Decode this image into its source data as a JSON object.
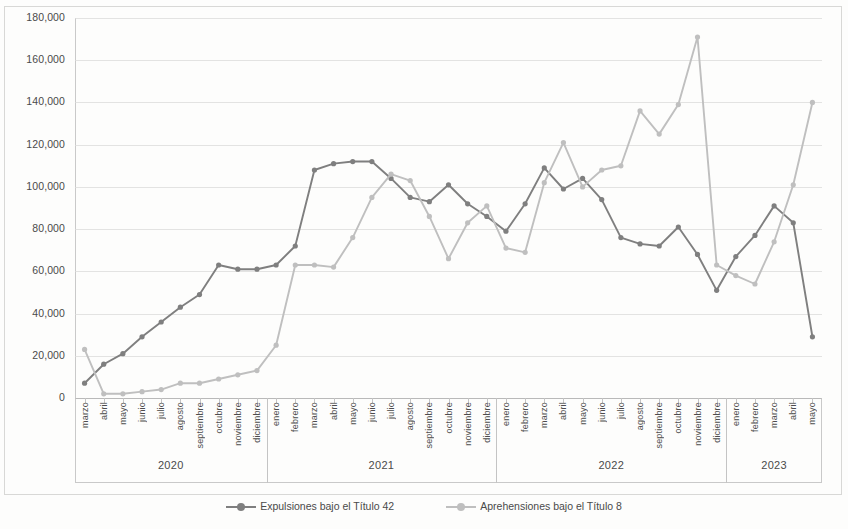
{
  "chart_data": {
    "type": "line",
    "title": "",
    "subtitle": "",
    "xlabel": "",
    "ylabel": "",
    "ylim": [
      0,
      180000
    ],
    "ytick_step": 20000,
    "ytick_labels": [
      "0",
      "20,000",
      "40,000",
      "60,000",
      "80,000",
      "100,000",
      "120,000",
      "140,000",
      "160,000",
      "180,000"
    ],
    "grid": true,
    "legend_position": "bottom",
    "categories": [
      "marzo",
      "abril",
      "mayo",
      "junio",
      "julio",
      "agosto",
      "septiembre",
      "octubre",
      "noviembre",
      "diciembre",
      "enero",
      "febrero",
      "marzo",
      "abril",
      "mayo",
      "junio",
      "julio",
      "agosto",
      "septiembre",
      "octubre",
      "noviembre",
      "diciembre",
      "enero",
      "febrero",
      "marzo",
      "abril",
      "mayo",
      "junio",
      "julio",
      "agosto",
      "septiembre",
      "octubre",
      "noviembre",
      "diciembre",
      "enero",
      "febrero",
      "marzo",
      "abril",
      "mayo"
    ],
    "year_groups": [
      {
        "label": "2020",
        "start_index": 0,
        "count": 10
      },
      {
        "label": "2021",
        "start_index": 10,
        "count": 12
      },
      {
        "label": "2022",
        "start_index": 22,
        "count": 12
      },
      {
        "label": "2023",
        "start_index": 34,
        "count": 5
      }
    ],
    "series": [
      {
        "name": "Expulsiones bajo el Título 42",
        "color": "#7f7f7f",
        "values": [
          7000,
          16000,
          21000,
          29000,
          36000,
          43000,
          49000,
          63000,
          61000,
          61000,
          63000,
          72000,
          108000,
          111000,
          112000,
          112000,
          104000,
          95000,
          93000,
          101000,
          92000,
          86000,
          79000,
          92000,
          109000,
          99000,
          104000,
          94000,
          76000,
          73000,
          72000,
          81000,
          68000,
          51000,
          67000,
          77000,
          91000,
          83000,
          29000
        ]
      },
      {
        "name": "Aprehensiones bajo el Título 8",
        "color": "#bfbfbf",
        "values": [
          23000,
          2000,
          2000,
          3000,
          4000,
          7000,
          7000,
          9000,
          11000,
          13000,
          25000,
          63000,
          63000,
          62000,
          76000,
          95000,
          106000,
          103000,
          86000,
          66000,
          83000,
          91000,
          71000,
          69000,
          102000,
          121000,
          100000,
          108000,
          110000,
          136000,
          125000,
          139000,
          171000,
          63000,
          58000,
          54000,
          74000,
          101000,
          140000
        ]
      }
    ]
  },
  "legend": {
    "items": [
      {
        "label": "Expulsiones bajo el Título 42",
        "color": "#7f7f7f"
      },
      {
        "label": "Aprehensiones bajo el Título 8",
        "color": "#bfbfbf"
      }
    ]
  }
}
